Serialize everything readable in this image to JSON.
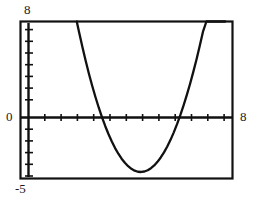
{
  "chart_data": {
    "type": "line",
    "title": "",
    "subtitle": "",
    "xlabel": "",
    "ylabel": "",
    "xlim": [
      -5,
      8
    ],
    "ylim": [
      -5,
      8
    ],
    "grid": false,
    "legend": null,
    "frame": true,
    "axis_labels": {
      "y_max": "8",
      "y_zero": "0",
      "x_max": "8",
      "y_min": "-5"
    },
    "tick_marks": {
      "x_axis_ticks": [
        -4,
        -3,
        -2,
        -1,
        0,
        1,
        2,
        3,
        4,
        5,
        6,
        7,
        8
      ],
      "y_axis_ticks": [
        -5,
        -4,
        -3,
        -2,
        -1,
        0,
        1,
        2,
        3,
        4,
        5,
        6,
        7,
        8
      ],
      "tick_interval": 1
    },
    "series": [
      {
        "name": "parabola",
        "style": "solid",
        "color": "#111111",
        "x": [
          -1.55,
          -1.4,
          -1.2,
          -1.0,
          -0.8,
          -0.6,
          -0.4,
          -0.2,
          0.0,
          0.2,
          0.4,
          0.6,
          0.8,
          1.0,
          1.2,
          1.4,
          1.6,
          1.8,
          2.0,
          2.2,
          2.4,
          2.6,
          2.8,
          3.0,
          3.2,
          3.4,
          3.6,
          3.8,
          4.0,
          4.2,
          4.4,
          4.6,
          4.8,
          5.0,
          5.2,
          5.4,
          5.6,
          5.8,
          6.0,
          6.2,
          6.4,
          6.6,
          6.8,
          7.0,
          7.2,
          7.4,
          7.55
        ],
        "y": [
          8.0,
          7.06,
          5.86,
          4.73,
          3.66,
          2.66,
          1.73,
          0.86,
          0.06,
          -0.67,
          -1.34,
          -1.94,
          -2.48,
          -2.95,
          -3.36,
          -3.7,
          -3.98,
          -4.2,
          -4.35,
          -4.44,
          -4.46,
          -4.42,
          -4.32,
          -4.15,
          -3.92,
          -3.62,
          -3.26,
          -2.84,
          -2.35,
          -1.8,
          -1.18,
          -0.5,
          0.24,
          1.05,
          1.92,
          2.85,
          3.85,
          4.9,
          6.03,
          7.21,
          8.0,
          8.0,
          8.0,
          8.0,
          8.0,
          8.0,
          8.0
        ]
      }
    ],
    "key_points": {
      "vertex": {
        "x": 2.45,
        "y": -4.46
      },
      "x_intercepts": [
        0.02,
        4.65
      ]
    },
    "colors": {
      "curve": "#111111",
      "axis": "#111111",
      "frame": "#111111",
      "background": "#ffffff",
      "text": "#1a1a1a"
    }
  }
}
